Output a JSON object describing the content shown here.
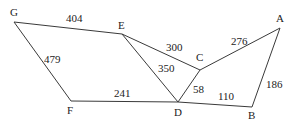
{
  "diagram": {
    "type": "weighted-graph",
    "nodes": [
      {
        "id": "G",
        "label": "G",
        "x": 14,
        "y": 22,
        "lx": 10,
        "ly": 16
      },
      {
        "id": "E",
        "label": "E",
        "x": 122,
        "y": 34,
        "lx": 118,
        "ly": 29
      },
      {
        "id": "C",
        "label": "C",
        "x": 200,
        "y": 70,
        "lx": 196,
        "ly": 61
      },
      {
        "id": "A",
        "label": "A",
        "x": 280,
        "y": 28,
        "lx": 276,
        "ly": 22
      },
      {
        "id": "F",
        "label": "F",
        "x": 71,
        "y": 101,
        "lx": 67,
        "ly": 114
      },
      {
        "id": "D",
        "label": "D",
        "x": 178,
        "y": 102,
        "lx": 174,
        "ly": 116
      },
      {
        "id": "B",
        "label": "B",
        "x": 252,
        "y": 107,
        "lx": 248,
        "ly": 119
      }
    ],
    "edges": [
      {
        "from": "G",
        "to": "E",
        "weight": "404",
        "lx": 66,
        "ly": 22
      },
      {
        "from": "G",
        "to": "F",
        "weight": "479",
        "lx": 44,
        "ly": 63
      },
      {
        "from": "E",
        "to": "C",
        "weight": "300",
        "lx": 166,
        "ly": 51
      },
      {
        "from": "E",
        "to": "D",
        "weight": "350",
        "lx": 158,
        "ly": 72
      },
      {
        "from": "C",
        "to": "A",
        "weight": "276",
        "lx": 231,
        "ly": 45
      },
      {
        "from": "C",
        "to": "D",
        "weight": "58",
        "lx": 193,
        "ly": 93
      },
      {
        "from": "F",
        "to": "D",
        "weight": "241",
        "lx": 114,
        "ly": 97
      },
      {
        "from": "D",
        "to": "B",
        "weight": "110",
        "lx": 218,
        "ly": 100
      },
      {
        "from": "A",
        "to": "B",
        "weight": "186",
        "lx": 266,
        "ly": 88
      }
    ]
  }
}
